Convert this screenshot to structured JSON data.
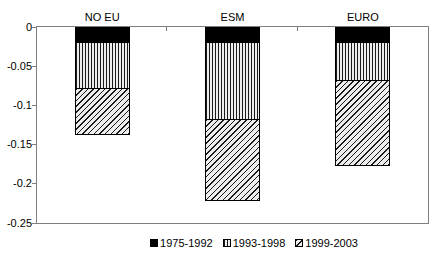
{
  "chart_data": {
    "type": "bar",
    "stacked": true,
    "bar_direction": "downward-from-zero",
    "title": "",
    "xlabel": "",
    "ylabel": "",
    "categories": [
      "NO EU",
      "ESM",
      "EURO"
    ],
    "series": [
      {
        "name": "1975-1992",
        "pattern": "solid-black",
        "values": [
          -0.02,
          -0.02,
          -0.02
        ]
      },
      {
        "name": "1993-1998",
        "pattern": "vertical-stripes",
        "values": [
          -0.06,
          -0.1,
          -0.05
        ]
      },
      {
        "name": "1999-2003",
        "pattern": "diagonal-stripes",
        "values": [
          -0.06,
          -0.105,
          -0.11
        ]
      }
    ],
    "cumulative_totals": [
      -0.14,
      -0.225,
      -0.18
    ],
    "ylim": [
      0,
      -0.25
    ],
    "ytick_labels": [
      "0",
      "-0.05",
      "-0.1",
      "-0.15",
      "-0.2",
      "-0.25"
    ],
    "ytick_values": [
      0,
      -0.05,
      -0.1,
      -0.15,
      -0.2,
      -0.25
    ],
    "grid": false,
    "legend_position": "bottom-center",
    "category_labels_position": "above-plot"
  },
  "colors": {
    "background": "#ffffff",
    "frame_border": "#7f7f7f",
    "bar_border": "#000000",
    "text": "#000000",
    "solid_series": "#000000",
    "pattern_line": "#1a1a1a",
    "pattern_background": "#ededed"
  }
}
